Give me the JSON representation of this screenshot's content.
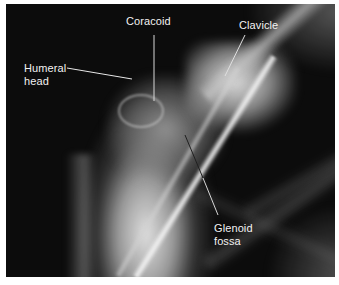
{
  "figure": {
    "background_color": "#0c0c0c",
    "label_color": "#f2f2f2",
    "labels": [
      {
        "id": "coracoid",
        "lines": [
          "Coracoid"
        ]
      },
      {
        "id": "clavicle",
        "lines": [
          "Clavicle"
        ]
      },
      {
        "id": "humeral-head",
        "lines": [
          "Humeral",
          "head"
        ]
      },
      {
        "id": "glenoid-fossa",
        "lines": [
          "Glenoid",
          "fossa"
        ]
      }
    ]
  }
}
